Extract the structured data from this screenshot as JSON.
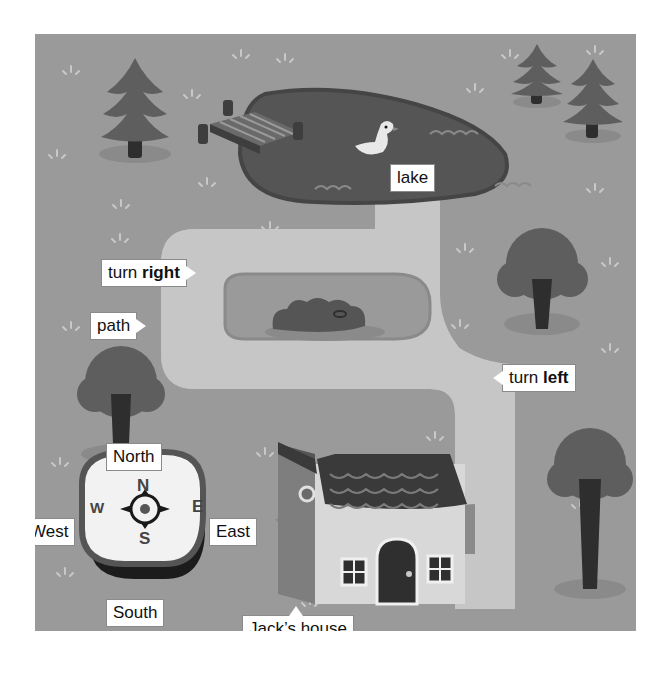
{
  "map": {
    "title": "Jack's neighbourhood map",
    "colors": {
      "ground": "#9a9a9a",
      "lake": "#555555",
      "path": "#c4c4c4",
      "tree_foliage": "#5e5e5e",
      "trunk": "#2e2e2e",
      "label_bg": "#ffffff",
      "label_text": "#111111"
    },
    "labels": {
      "lake": "lake",
      "turn_right_prefix": "turn",
      "turn_right_bold": "right",
      "path": "path",
      "turn_left_prefix": "turn",
      "turn_left_bold": "left",
      "house": "Jack’s house"
    },
    "compass": {
      "labels": {
        "north": "North",
        "south": "South",
        "east": "East",
        "west": "West"
      },
      "letters": {
        "n": "N",
        "s": "S",
        "e": "E",
        "w": "W"
      }
    },
    "objects": [
      "pine-tree",
      "pine-tree",
      "pine-tree",
      "jetty",
      "lake",
      "duck",
      "round-tree",
      "round-tree",
      "round-tree",
      "bush",
      "house",
      "compass",
      "winding-path"
    ]
  }
}
